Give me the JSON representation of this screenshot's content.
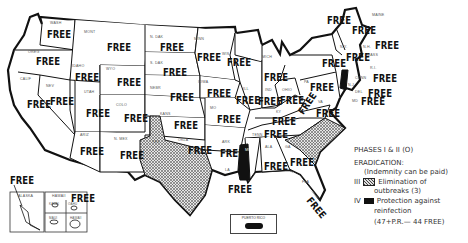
{
  "map": {
    "title": "Brucellosis eradication status by state",
    "status_label": "FREE",
    "states": [
      {
        "abbr": "WASH",
        "status": "FREE"
      },
      {
        "abbr": "OREG",
        "status": "FREE"
      },
      {
        "abbr": "CALIF",
        "status": "FREE"
      },
      {
        "abbr": "NEV",
        "status": "FREE"
      },
      {
        "abbr": "IDAHO",
        "status": "FREE"
      },
      {
        "abbr": "MONT",
        "status": "FREE"
      },
      {
        "abbr": "WYO",
        "status": "FREE"
      },
      {
        "abbr": "UTAH",
        "status": "FREE"
      },
      {
        "abbr": "COLO",
        "status": "FREE"
      },
      {
        "abbr": "ARIZ",
        "status": "FREE"
      },
      {
        "abbr": "N. MEX",
        "status": "FREE"
      },
      {
        "abbr": "N. DAK",
        "status": "FREE"
      },
      {
        "abbr": "S. DAK",
        "status": "FREE"
      },
      {
        "abbr": "NEBR",
        "status": "FREE"
      },
      {
        "abbr": "KANS",
        "status": "FREE"
      },
      {
        "abbr": "OKLA",
        "status": "FREE"
      },
      {
        "abbr": "TEX",
        "status": "Phase III"
      },
      {
        "abbr": "MINN",
        "status": "FREE"
      },
      {
        "abbr": "IOWA",
        "status": "FREE"
      },
      {
        "abbr": "MO",
        "status": "FREE"
      },
      {
        "abbr": "ARK",
        "status": "FREE"
      },
      {
        "abbr": "LA",
        "status": "FREE"
      },
      {
        "abbr": "WIS",
        "status": "FREE"
      },
      {
        "abbr": "ILL",
        "status": "FREE"
      },
      {
        "abbr": "MICH",
        "status": "FREE"
      },
      {
        "abbr": "IND",
        "status": "FREE"
      },
      {
        "abbr": "OHIO",
        "status": "FREE"
      },
      {
        "abbr": "KY",
        "status": "FREE"
      },
      {
        "abbr": "TENN",
        "status": "FREE"
      },
      {
        "abbr": "MISS",
        "status": "Phase IV"
      },
      {
        "abbr": "ALA",
        "status": "FREE"
      },
      {
        "abbr": "GA",
        "status": "FREE"
      },
      {
        "abbr": "FLA",
        "status": "FREE"
      },
      {
        "abbr": "S.C.",
        "status": "Phase III"
      },
      {
        "abbr": "N.C.",
        "status": "Phase III"
      },
      {
        "abbr": "VA",
        "status": "FREE"
      },
      {
        "abbr": "W. VA",
        "status": "FREE"
      },
      {
        "abbr": "PA",
        "status": "FREE"
      },
      {
        "abbr": "N.Y.",
        "status": "FREE"
      },
      {
        "abbr": "VT",
        "status": "FREE"
      },
      {
        "abbr": "N.H.",
        "status": "FREE"
      },
      {
        "abbr": "MAINE",
        "status": "FREE"
      },
      {
        "abbr": "MASS",
        "status": "FREE"
      },
      {
        "abbr": "R.I.",
        "status": "Phase IV"
      },
      {
        "abbr": "CONN",
        "status": "FREE"
      },
      {
        "abbr": "N.J.",
        "status": "Phase IV"
      },
      {
        "abbr": "DEL",
        "status": "FREE"
      },
      {
        "abbr": "MD",
        "status": "FREE"
      },
      {
        "abbr": "ALASKA",
        "status": "FREE"
      },
      {
        "abbr": "HAWAII",
        "status": "FREE"
      }
    ],
    "hawaii_islands": [
      "KAUAI",
      "OAHU",
      "MAUI",
      "HAWAII"
    ],
    "puerto_rico_label": "PUERTO RICO"
  },
  "legend": {
    "line1": "PHASES I & II (O)",
    "line2": "ERADICATION:",
    "line3": "(Indemnity can be paid)",
    "phase3_numeral": "III",
    "phase3_text_a": "Elimination of",
    "phase3_text_b": "outbreaks  (3)",
    "phase4_numeral": "IV",
    "phase4_text_a": "Protection against",
    "phase4_text_b": "reinfection",
    "summary": "(47+P.R.— 44 FREE)"
  },
  "colors": {
    "outline": "#111111",
    "phase4_fill": "#111111",
    "phase3_hatch": "#bbbbbb",
    "background": "#ffffff"
  }
}
